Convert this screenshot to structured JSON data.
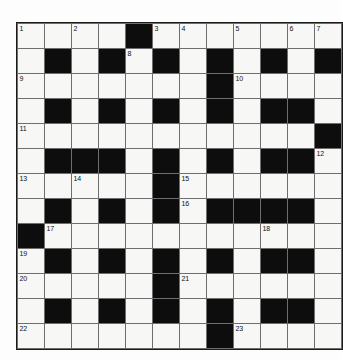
{
  "puzzle": {
    "title": "Crossword Grid",
    "type": "crossword",
    "columns": 12,
    "rows": 13,
    "colors": {
      "block": "#0d0d0d",
      "cell": "#f7f7f5",
      "grid_line": "#6e6e6e",
      "border": "#1a1a1a",
      "number_text": "#111111",
      "page_background": "#fdfdfd"
    },
    "legend": {
      "0": "white-cell",
      "1": "black-cell"
    },
    "grid": [
      [
        0,
        0,
        0,
        0,
        1,
        0,
        0,
        0,
        0,
        0,
        0,
        0
      ],
      [
        0,
        1,
        0,
        1,
        0,
        1,
        0,
        1,
        0,
        1,
        0,
        1
      ],
      [
        0,
        0,
        0,
        0,
        0,
        0,
        0,
        1,
        0,
        0,
        0,
        0
      ],
      [
        0,
        1,
        0,
        1,
        0,
        1,
        0,
        1,
        0,
        1,
        1,
        0
      ],
      [
        0,
        0,
        0,
        0,
        0,
        0,
        0,
        0,
        0,
        0,
        0,
        1
      ],
      [
        0,
        1,
        1,
        1,
        0,
        1,
        0,
        1,
        0,
        1,
        1,
        0
      ],
      [
        0,
        0,
        0,
        0,
        0,
        1,
        0,
        0,
        0,
        0,
        0,
        0
      ],
      [
        0,
        1,
        0,
        1,
        0,
        1,
        0,
        1,
        1,
        1,
        1,
        0
      ],
      [
        1,
        0,
        0,
        0,
        0,
        0,
        0,
        0,
        0,
        0,
        0,
        0
      ],
      [
        0,
        1,
        0,
        1,
        0,
        1,
        0,
        1,
        0,
        1,
        1,
        0
      ],
      [
        0,
        0,
        0,
        0,
        0,
        1,
        0,
        0,
        0,
        0,
        0,
        0
      ],
      [
        0,
        1,
        0,
        1,
        0,
        1,
        0,
        1,
        0,
        1,
        1,
        0
      ],
      [
        0,
        0,
        0,
        0,
        0,
        0,
        0,
        1,
        0,
        0,
        0,
        0
      ]
    ],
    "numbers": [
      {
        "row": 0,
        "col": 0,
        "label": "1"
      },
      {
        "row": 0,
        "col": 2,
        "label": "2"
      },
      {
        "row": 0,
        "col": 5,
        "label": "3"
      },
      {
        "row": 0,
        "col": 6,
        "label": "4"
      },
      {
        "row": 0,
        "col": 8,
        "label": "5"
      },
      {
        "row": 0,
        "col": 10,
        "label": "6"
      },
      {
        "row": 0,
        "col": 11,
        "label": "7"
      },
      {
        "row": 1,
        "col": 4,
        "label": "8"
      },
      {
        "row": 2,
        "col": 0,
        "label": "9"
      },
      {
        "row": 2,
        "col": 8,
        "label": "10"
      },
      {
        "row": 4,
        "col": 0,
        "label": "11"
      },
      {
        "row": 5,
        "col": 11,
        "label": "12"
      },
      {
        "row": 6,
        "col": 0,
        "label": "13"
      },
      {
        "row": 6,
        "col": 2,
        "label": "14"
      },
      {
        "row": 6,
        "col": 6,
        "label": "15"
      },
      {
        "row": 7,
        "col": 6,
        "label": "16"
      },
      {
        "row": 8,
        "col": 1,
        "label": "17"
      },
      {
        "row": 8,
        "col": 9,
        "label": "18"
      },
      {
        "row": 9,
        "col": 0,
        "label": "19"
      },
      {
        "row": 10,
        "col": 0,
        "label": "20"
      },
      {
        "row": 10,
        "col": 6,
        "label": "21"
      },
      {
        "row": 12,
        "col": 0,
        "label": "22"
      },
      {
        "row": 12,
        "col": 8,
        "label": "23"
      }
    ],
    "letters": []
  }
}
